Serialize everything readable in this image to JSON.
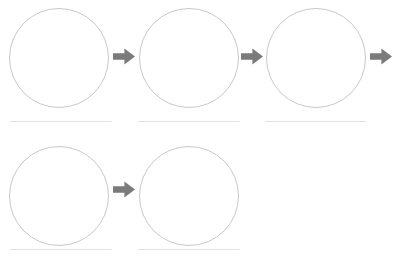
{
  "page": {
    "background_color": "#ffffff",
    "width": 397,
    "height": 262
  },
  "style": {
    "circle_stroke_color": "#c9c9c9",
    "circle_stroke_width": 1,
    "circle_fill": "#ffffff",
    "line_color": "#e2e2e2",
    "arrow_color": "#7b7b7b"
  },
  "diagram": {
    "type": "sequence-flow",
    "row_count": 2,
    "total_circles": 5,
    "total_arrows": 4,
    "total_write_lines": 5
  },
  "rows": [
    {
      "name": "row-1",
      "top": 8,
      "circles": [
        {
          "name": "circle-1",
          "label": "",
          "x": 9,
          "y": 8,
          "size": 100,
          "line": {
            "x": 10,
            "y": 121,
            "width": 102
          }
        },
        {
          "name": "circle-2",
          "label": "",
          "x": 139,
          "y": 8,
          "size": 100,
          "line": {
            "x": 138,
            "y": 121,
            "width": 102
          }
        },
        {
          "name": "circle-3",
          "label": "",
          "x": 266,
          "y": 8,
          "size": 100,
          "line": {
            "x": 265,
            "y": 121,
            "width": 101
          }
        }
      ],
      "arrows": [
        {
          "name": "arrow-1",
          "x": 113,
          "y": 48,
          "width": 22,
          "height": 17,
          "direction": "right"
        },
        {
          "name": "arrow-2",
          "x": 241,
          "y": 48,
          "width": 22,
          "height": 17,
          "direction": "right"
        },
        {
          "name": "arrow-3",
          "x": 370,
          "y": 48,
          "width": 22,
          "height": 17,
          "direction": "right"
        }
      ]
    },
    {
      "name": "row-2",
      "top": 146,
      "circles": [
        {
          "name": "circle-4",
          "label": "",
          "x": 9,
          "y": 146,
          "size": 100,
          "line": {
            "x": 10,
            "y": 249,
            "width": 102
          }
        },
        {
          "name": "circle-5",
          "label": "",
          "x": 139,
          "y": 146,
          "size": 100,
          "line": {
            "x": 138,
            "y": 249,
            "width": 102
          }
        }
      ],
      "arrows": [
        {
          "name": "arrow-4",
          "x": 113,
          "y": 181,
          "width": 22,
          "height": 17,
          "direction": "right"
        }
      ]
    }
  ],
  "icons": {
    "arrow_right": "block-arrow-right-icon"
  }
}
